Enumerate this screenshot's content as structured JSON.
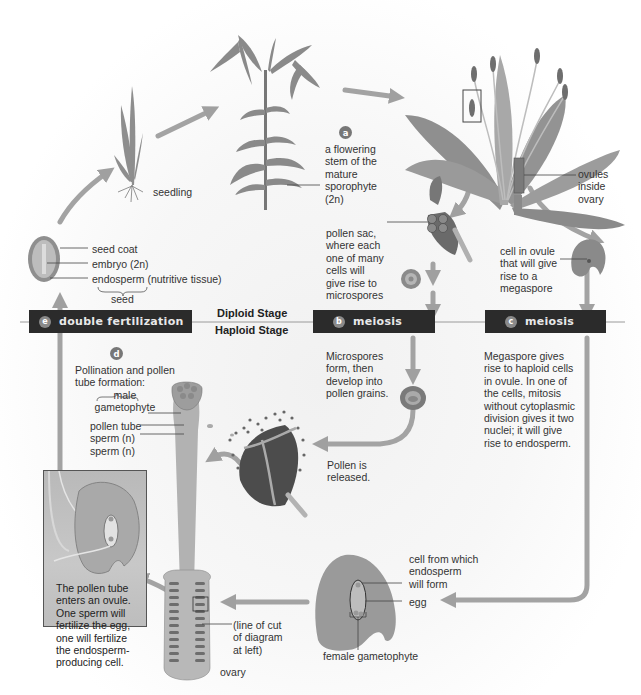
{
  "diagram": {
    "stage_labels": {
      "diploid": "Diploid Stage",
      "haploid": "Haploid Stage"
    },
    "banners": [
      {
        "badge": "e",
        "label": "double fertilization"
      },
      {
        "badge": "b",
        "label": "meiosis"
      },
      {
        "badge": "c",
        "label": "meiosis"
      }
    ],
    "step_a": {
      "badge": "a",
      "text_lines": [
        "a flowering",
        "stem of the",
        "mature",
        "sporophyte",
        "(2n)"
      ]
    },
    "step_d": {
      "badge": "d",
      "text_lines": [
        "Pollination and pollen",
        "tube formation:",
        "male",
        "gametophyte"
      ],
      "parts": [
        "pollen tube",
        "sperm (n)",
        "sperm (n)"
      ]
    },
    "labels": {
      "seedling": "seedling",
      "ovules_inside_ovary": [
        "ovules",
        "inside",
        "ovary"
      ],
      "pollen_sac": [
        "pollen sac,",
        "where each",
        "one of many",
        "cells will",
        "give rise to",
        "microspores"
      ],
      "cell_in_ovule": [
        "cell in ovule",
        "that will give",
        "rise to a",
        "megaspore"
      ],
      "seed_parts": [
        "seed coat",
        "embryo (2n)",
        "endosperm (nutritive tissue)"
      ],
      "seed": "seed",
      "microspores": [
        "Microspores",
        "form, then",
        "develop into",
        "pollen grains."
      ],
      "megaspore": [
        "Megaspore gives",
        "rise to haploid cells",
        "in ovule. In one of",
        "the cells, mitosis",
        "without cytoplasmic",
        "division gives it two",
        "nuclei; it will give",
        "rise to endosperm."
      ],
      "pollen_released": [
        "Pollen is",
        "released."
      ],
      "inset_text": [
        "The pollen tube",
        "enters an ovule.",
        "One sperm will",
        "fertilize the egg,",
        "one will fertilize",
        "the endosperm-",
        "producing cell."
      ],
      "line_of_cut": [
        "(line of cut",
        "of diagram",
        "at left)"
      ],
      "ovary": "ovary",
      "endosperm_cell": [
        "cell from which",
        "endosperm",
        "will form"
      ],
      "egg": "egg",
      "female_gametophyte": "female gametophyte"
    },
    "colors": {
      "banner_bg": "#2b2b2b",
      "arrow": "#9a9a9a",
      "plant": "#8c8c8c",
      "plant_dark": "#6a6a6a",
      "text": "#333333"
    }
  }
}
